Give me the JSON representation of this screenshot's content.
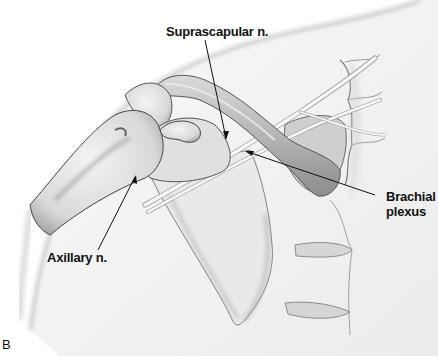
{
  "figure": {
    "panel_letter": "B",
    "labels": {
      "suprascapular": "Suprascapular n.",
      "brachial_line1": "Brachial",
      "brachial_line2": "plexus",
      "axillary": "Axillary n."
    },
    "colors": {
      "background": "#ffffff",
      "bone_fill": "#e6e6e6",
      "shadow": "#9a9a9a",
      "outline": "#555555",
      "leader_line": "#111111",
      "nerve": "#f7f7f7"
    }
  }
}
